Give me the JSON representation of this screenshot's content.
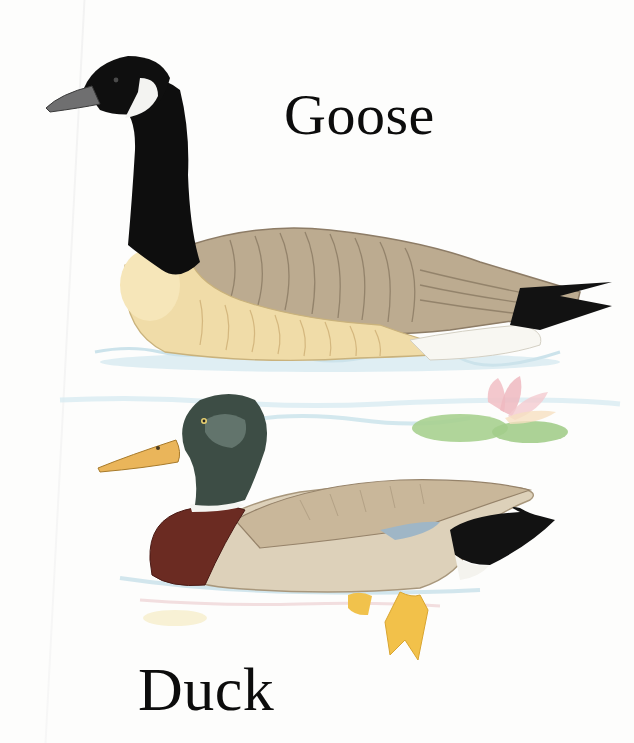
{
  "labels": {
    "goose": "Goose",
    "duck": "Duck"
  },
  "illustration": {
    "subjects": [
      {
        "name": "Canada goose",
        "position": "top",
        "colors": {
          "head_neck": "#0d0d0d",
          "cheek": "#f2f2f0",
          "chest": "#f1dca6",
          "back": "#b9a88d",
          "tail": "#111111"
        }
      },
      {
        "name": "Mallard duck",
        "position": "middle",
        "colors": {
          "head": "#3c4c44",
          "bill": "#e9b45a",
          "breast": "#6b2a22",
          "body": "#ddd2bc",
          "feet": "#f0c04a"
        }
      },
      {
        "name": "Water lily",
        "position": "right-middle",
        "colors": {
          "pad": "#a8d192",
          "flower": "#f3c3c8"
        }
      }
    ],
    "water_color": "#cfe6ef"
  }
}
